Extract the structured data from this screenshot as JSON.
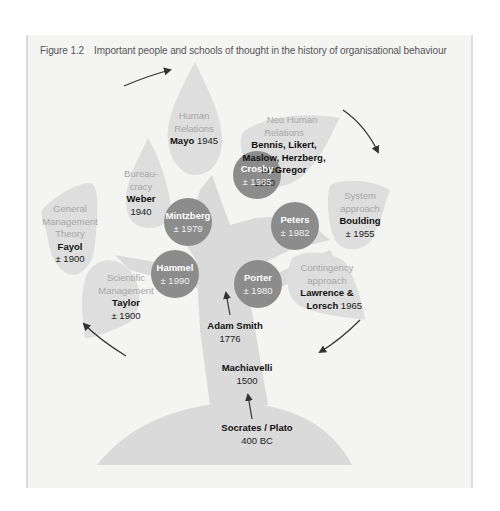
{
  "figure": {
    "number": "Figure 1.2",
    "title": "Important people and schools of thought in the history of organisational behaviour"
  },
  "colors": {
    "background": "#f4f4f3",
    "leaf": "#dedede",
    "tree": "#dadada",
    "circle": "#8c8c8c",
    "school_text": "#a6a6a6",
    "name_text": "#111111",
    "arrow": "#333333"
  },
  "leaves": [
    {
      "school": [
        "Human",
        "Relations"
      ],
      "name": "Mayo",
      "year": "1945"
    },
    {
      "school": [
        "Neo Human",
        "Relations"
      ],
      "name": "Bennis, Likert, Maslow, Herzberg, McGregor",
      "name_lines": [
        "Bennis, Likert,",
        "Maslow, Herzberg,",
        "McGregor"
      ],
      "year": "1960"
    },
    {
      "school": [
        "Bureau-",
        "cracy"
      ],
      "name": "Weber",
      "year": "1940"
    },
    {
      "school": [
        "General",
        "Management",
        "Theory"
      ],
      "name": "Fayol",
      "year": "± 1900"
    },
    {
      "school": [
        "System",
        "approach"
      ],
      "name": "Boulding",
      "year": "± 1955"
    },
    {
      "school": [
        "Scientific",
        "Management"
      ],
      "name": "Taylor",
      "year": "± 1900"
    },
    {
      "school": [
        "Contingency",
        "approach"
      ],
      "name": "Lawrence & Lorsch",
      "name_lines": [
        "Lawrence &",
        "Lorsch"
      ],
      "year": "1965"
    }
  ],
  "circles": [
    {
      "name": "Crosby",
      "year": "± 1985"
    },
    {
      "name": "Mintzberg",
      "year": "± 1979"
    },
    {
      "name": "Peters",
      "year": "± 1982"
    },
    {
      "name": "Hammel",
      "year": "± 1990"
    },
    {
      "name": "Porter",
      "year": "± 1980"
    }
  ],
  "trunk": [
    {
      "name": "Adam Smith",
      "year": "1776"
    },
    {
      "name": "Machiavelli",
      "year": "1500"
    },
    {
      "name": "Socrates / Plato",
      "year": "400 BC"
    }
  ]
}
